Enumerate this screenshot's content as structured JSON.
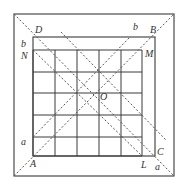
{
  "diagram": {
    "type": "geometry-figure",
    "colors": {
      "line": "#3a3a3a",
      "dashed": "#555555",
      "label": "#333333",
      "background": "#ffffff"
    },
    "outer_square": {
      "x1": 14,
      "y1": 14,
      "x2": 174,
      "y2": 176
    },
    "inner_square": {
      "label": "ABCD",
      "x1": 33,
      "y1": 37,
      "x2": 155,
      "y2": 156
    },
    "grid": {
      "x_lines": [
        33,
        55,
        77,
        99,
        121,
        142
      ],
      "y_lines": [
        50,
        72,
        93,
        115,
        137,
        156
      ]
    },
    "labels": {
      "A": "A",
      "B": "B",
      "C": "C",
      "D": "D",
      "M": "M",
      "N": "N",
      "L": "L",
      "O": "O",
      "a_left": "a",
      "a_bottom": "a",
      "b_left": "b",
      "b_top": "b"
    }
  }
}
